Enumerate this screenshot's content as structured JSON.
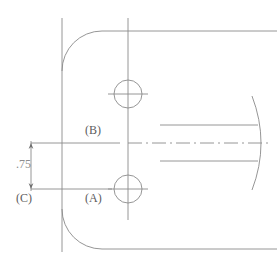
{
  "drawing": {
    "title": "Plate detail view with datum references",
    "view_type": "orthographic-2d",
    "units": "inch",
    "background_color": "#ffffff",
    "line_color": "#8a8a8a",
    "text_color": "#5c5c5c",
    "dim_text_color": "#8d8d8d",
    "labels": {
      "datum_a": "(A)",
      "datum_b": "(B)",
      "datum_c": "(C)"
    },
    "dimensions": [
      {
        "name": "datum-c-to-b-vertical",
        "value": ".75",
        "orientation": "vertical",
        "from": "(C)",
        "to": "(B)"
      }
    ],
    "features": {
      "plate": {
        "name": "rounded-plate-outline",
        "corner_radius": 40,
        "top_edge_y": 31,
        "bottom_edge_y": 249,
        "left_edge_x": 62
      },
      "holes": [
        {
          "name": "upper-hole",
          "datum": "(B)",
          "cx": 128,
          "cy": 94,
          "r": 14
        },
        {
          "name": "lower-hole",
          "datum": "(A)",
          "cx": 128,
          "cy": 189,
          "r": 14
        }
      ],
      "shaft": {
        "name": "horizontal-shaft",
        "top_y": 125,
        "bottom_y": 161,
        "start_x": 160,
        "end_x": 262,
        "centerline_y": 143
      }
    }
  }
}
